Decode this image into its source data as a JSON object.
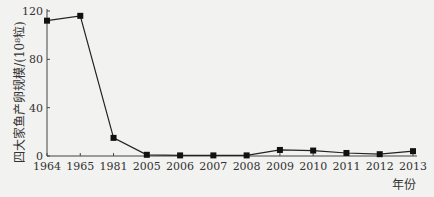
{
  "chart_data": {
    "type": "line",
    "title": "",
    "xlabel": "年份",
    "ylabel": "四大家鱼产卵规模/(10⁸粒)",
    "categories": [
      "1964",
      "1965",
      "1981",
      "2005",
      "2006",
      "2007",
      "2008",
      "2009",
      "2010",
      "2011",
      "2012",
      "2013"
    ],
    "series": [
      {
        "name": "四大家鱼产卵规模",
        "values": [
          112,
          116,
          15,
          1,
          0.5,
          0.5,
          0.5,
          5,
          4.5,
          2.5,
          1.5,
          4
        ]
      }
    ],
    "ylim": [
      0,
      120
    ],
    "yticks": [
      0,
      40,
      80,
      120
    ],
    "grid": false,
    "legend": "none",
    "colors": {
      "line": "#222222",
      "marker": "#111111",
      "axis": "#444444",
      "background": "#f2f2f0"
    }
  }
}
